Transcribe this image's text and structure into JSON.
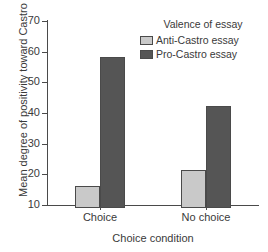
{
  "chart_data": {
    "type": "bar",
    "title": "",
    "xlabel": "Choice condition",
    "ylabel": "Mean degree of positivity toward Castro",
    "categories": [
      "Choice",
      "No choice"
    ],
    "series": [
      {
        "name": "Anti-Castro essay",
        "values": [
          17.3,
          22.5
        ],
        "color": "#c9c9c9"
      },
      {
        "name": "Pro-Castro essay",
        "values": [
          59.3,
          43.3
        ],
        "color": "#555555"
      }
    ],
    "ylim": [
      10,
      70
    ],
    "yticks": [
      10,
      20,
      30,
      40,
      50,
      60,
      70
    ],
    "ytick_labels": [
      "10",
      "20",
      "30",
      "40",
      "50",
      "60",
      "70"
    ],
    "grid": false,
    "legend": {
      "title": "Valence of essay",
      "position": "top-right",
      "entries": [
        "Anti-Castro essay",
        "Pro-Castro essay"
      ]
    }
  }
}
